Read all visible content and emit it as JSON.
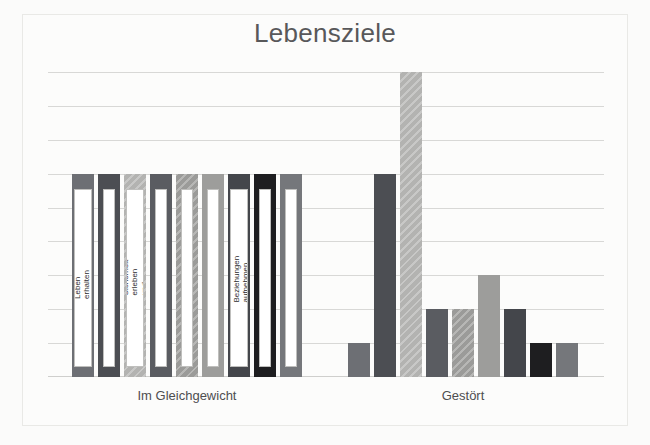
{
  "chart_data": {
    "type": "bar",
    "title": "Lebensziele",
    "xlabel": "",
    "ylabel": "",
    "grid": true,
    "gridlines": 9,
    "legend_position": "none",
    "axis_note": "y-axis unlabelled; values read off evenly spaced gridlines",
    "ylim": [
      0,
      9
    ],
    "categories": [
      "Im Gleichgewicht",
      "Gestört"
    ],
    "series": [
      {
        "name": "Leben erhalten und Entwicklung erfahren",
        "color": "#6d6f74",
        "hatch": false,
        "values": [
          6,
          1
        ]
      },
      {
        "name": "Das eigene Leben spüren",
        "color": "#4c4e53",
        "hatch": false,
        "values": [
          6,
          6
        ]
      },
      {
        "name": "Sicherheit erleben und Vertrauen aufbauen",
        "color": "#b3b3b1",
        "hatch": true,
        "values": [
          6,
          9
        ]
      },
      {
        "name": "Den eigenen Rhythmus entwickeln",
        "color": "#5a5c61",
        "hatch": false,
        "values": [
          6,
          2
        ]
      },
      {
        "name": "Das Leben selbst gestalten",
        "color": "#9b9b99",
        "hatch": true,
        "values": [
          6,
          2
        ]
      },
      {
        "name": "Die Außenwelt erfahren",
        "color": "#9d9d9b",
        "hatch": false,
        "values": [
          6,
          3
        ]
      },
      {
        "name": "Beziehungen aufnehmen und Begegnungen gestalten",
        "color": "#44464b",
        "hatch": false,
        "values": [
          6,
          2
        ]
      },
      {
        "name": "Sinn und Bedeutung geben und erfahren",
        "color": "#1e1e20",
        "hatch": false,
        "values": [
          6,
          1
        ]
      },
      {
        "name": "Autonomie und Verantwortung leben",
        "color": "#75777b",
        "hatch": false,
        "values": [
          6,
          1
        ]
      }
    ]
  },
  "chart": {
    "title": "Lebensziele",
    "category_left": "Im Gleichgewicht",
    "category_right": "Gestört",
    "bar_labels": [
      "Leben erhalten und Entwicklung erfahren",
      "Das eigene Leben spüren",
      "Sicherheit erleben und Vertrauen aufbauen",
      "Den eigenen Rhythmus entwickeln",
      "Das Leben selbst gestalten",
      "Die Außenwelt erfahren",
      "Beziehungen aufnehmen und Begegnungen gestalten",
      "Sinn und Bedeutung geben und erfahren",
      "Autonomie und Verantwortung leben"
    ]
  }
}
